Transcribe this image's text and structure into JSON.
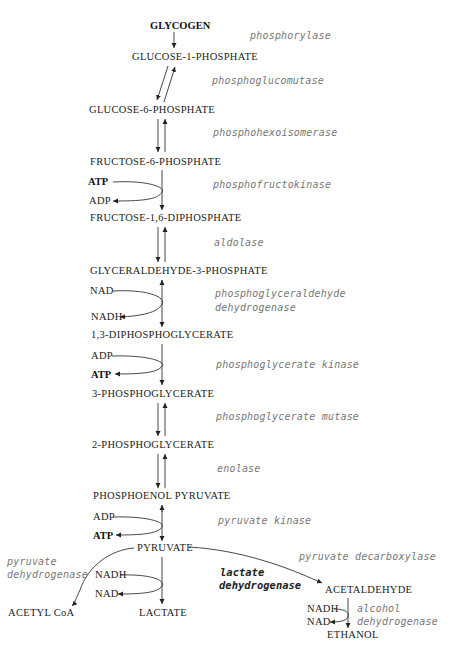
{
  "header": {
    "cutoff_text": ""
  },
  "metabolites": {
    "glycogen": "GLYCOGEN",
    "g1p": "GLUCOSE-1-PHOSPHATE",
    "g6p": "GLUCOSE-6-PHOSPHATE",
    "f6p": "FRUCTOSE-6-PHOSPHATE",
    "f16dp": "FRUCTOSE-1,6-DIPHOSPHATE",
    "g3p": "GLYCERALDEHYDE-3-PHOSPHATE",
    "dpg13": "1,3-DIPHOSPHOGLYCERATE",
    "pg3": "3-PHOSPHOGLYCERATE",
    "pg2": "2-PHOSPHOGLYCERATE",
    "pep": "PHOSPHOENOL PYRUVATE",
    "pyruvate": "PYRUVATE",
    "acetyl_coa": "ACETYL CoA",
    "lactate": "LACTATE",
    "acetaldehyde": "ACETALDEHYDE",
    "ethanol": "ETHANOL"
  },
  "cofactors": {
    "pfk_in": "ATP",
    "pfk_out": "ADP",
    "gapdh_in": "NAD",
    "gapdh_out": "NADH",
    "pgk_in": "ADP",
    "pgk_out": "ATP",
    "pk_in": "ADP",
    "pk_out": "ATP",
    "ldh_in": "NADH",
    "ldh_out": "NAD",
    "adh_in": "NADH",
    "adh_out": "NAD"
  },
  "enzymes": {
    "phosphorylase": "phosphorylase",
    "phosphoglucomutase": "phosphoglucomutase",
    "phosphohexoisomerase": "phosphohexoisomerase",
    "phosphofructokinase": "phosphofructokinase",
    "aldolase": "aldolase",
    "gapdh_line1": "phosphoglyceraldehyde",
    "gapdh_line2": "dehydrogenase",
    "pgk": "phosphoglycerate kinase",
    "pgm": "phosphoglycerate mutase",
    "enolase": "enolase",
    "pk": "pyruvate kinase",
    "pdh_line1": "pyruvate",
    "pdh_line2": "dehydrogenase",
    "pdc": "pyruvate decarboxylase",
    "ldh_line1": "lactate",
    "ldh_line2": "dehydrogenase",
    "adh_line1": "alcohol",
    "adh_line2": "dehydrogenase"
  },
  "colors": {
    "metabolite": "#222222",
    "enzyme": "#777777",
    "arrow": "#222222"
  }
}
